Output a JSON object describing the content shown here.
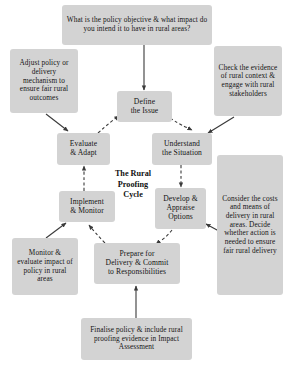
{
  "diagram": {
    "center_label_lines": [
      "The Rural",
      "Proofing",
      "Cycle"
    ],
    "box_fill_color": "#d3d3d3",
    "text_color": "#141414",
    "arrow_color": "#3a3a3a",
    "stages": [
      {
        "id": "define",
        "label": "Define\nthe Issue"
      },
      {
        "id": "understand",
        "label": "Understand\nthe Situation"
      },
      {
        "id": "develop",
        "label": "Develop &\nAppraise\nOptions"
      },
      {
        "id": "prepare",
        "label": "Prepare for\nDelivery & Commit\nto Responsibilities"
      },
      {
        "id": "implement",
        "label": "Implement\n& Monitor"
      },
      {
        "id": "evaluate",
        "label": "Evaluate\n& Adapt"
      }
    ],
    "annotations": [
      {
        "id": "policy-objective",
        "label": "What is the policy objective & what impact do you intend it to have in rural areas?"
      },
      {
        "id": "check-evidence",
        "label": "Check the evidence of rural context & engage with rural stakeholders"
      },
      {
        "id": "consider-costs",
        "label": "Consider the costs and means of delivery in rural areas. Decide whether action is needed to ensure fair rural delivery"
      },
      {
        "id": "finalise-policy",
        "label": "Finalise policy & include rural proofing evidence in Impact Assessment"
      },
      {
        "id": "monitor-evaluate",
        "label": "Monitor & evaluate impact of policy in rural areas"
      },
      {
        "id": "adjust-policy",
        "label": "Adjust policy or delivery mechanism to ensure fair rural outcomes"
      }
    ]
  }
}
